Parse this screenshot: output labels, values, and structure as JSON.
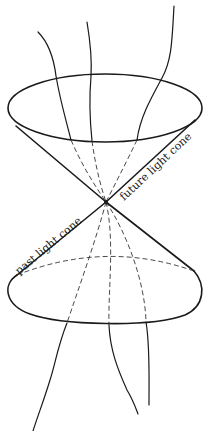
{
  "diagram": {
    "labels": {
      "future": "future light cone",
      "past": "past light cone"
    },
    "colors": {
      "stroke": "#1a1a1a",
      "background": "#ffffff"
    },
    "apex": [
      106,
      202
    ],
    "future_cone_rim": {
      "cx": 105,
      "cy": 108,
      "rx": 97,
      "ry": 34
    },
    "past_cone_rim": {
      "cx": 106,
      "cy": 291,
      "rx": 97,
      "ry": 33
    }
  }
}
